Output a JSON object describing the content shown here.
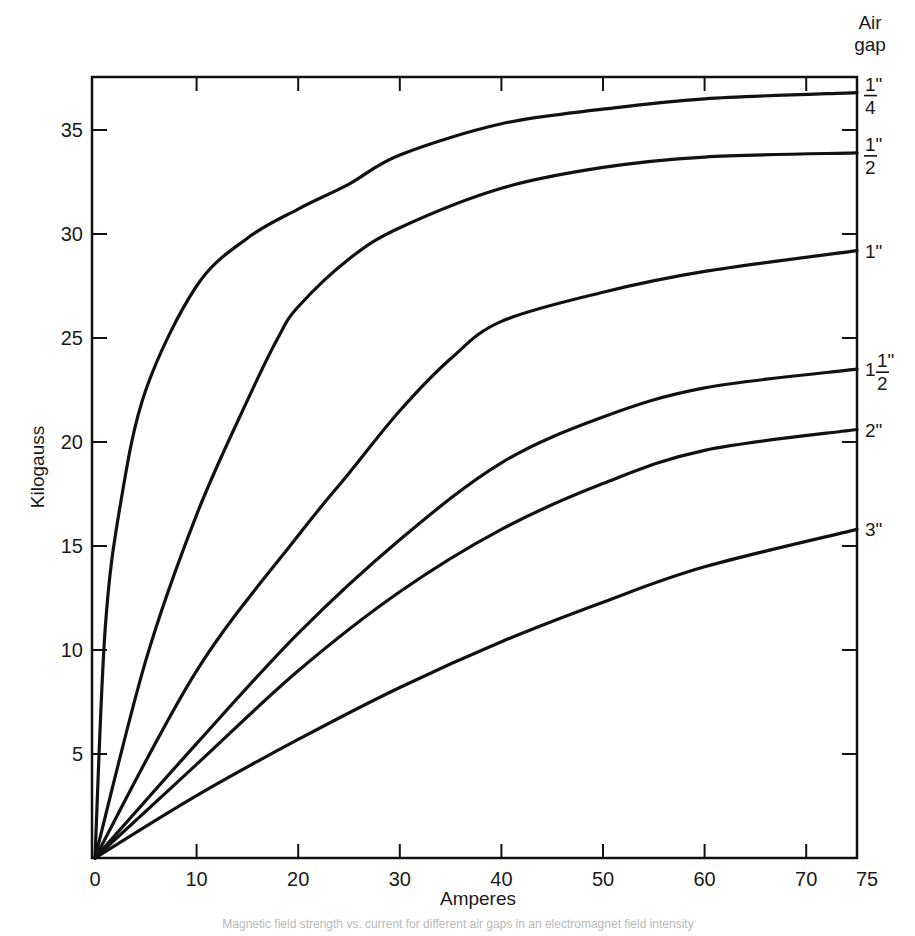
{
  "chart_data": {
    "type": "line",
    "title": "",
    "xlabel": "Amperes",
    "ylabel": "Kilogauss",
    "xlim": [
      0,
      75
    ],
    "ylim": [
      0,
      37.5
    ],
    "grid": false,
    "x_ticks": [
      0,
      10,
      20,
      30,
      40,
      50,
      60,
      70,
      75
    ],
    "x_tick_labels": [
      "0",
      "10",
      "20",
      "30",
      "40",
      "50",
      "60",
      "70",
      "75"
    ],
    "y_ticks": [
      5,
      10,
      15,
      20,
      25,
      30,
      35
    ],
    "y_tick_labels": [
      "5",
      "10",
      "15",
      "20",
      "25",
      "30",
      "35"
    ],
    "legend_title": "Air gap",
    "legend_position": "right edge, labels at curve ends",
    "series": [
      {
        "name": "1/4\"",
        "label_whole": "",
        "label_num": "1",
        "label_den": "4",
        "x": [
          0,
          1,
          2.5,
          5,
          10,
          15,
          20,
          25,
          30,
          40,
          50,
          60,
          75
        ],
        "y": [
          0,
          11,
          17,
          22.5,
          27.5,
          29.8,
          31.2,
          32.4,
          33.8,
          35.3,
          36.0,
          36.5,
          36.8
        ]
      },
      {
        "name": "1/2\"",
        "label_whole": "",
        "label_num": "1",
        "label_den": "2",
        "x": [
          0,
          5,
          10,
          15,
          18,
          20,
          25,
          30,
          40,
          50,
          60,
          75
        ],
        "y": [
          0,
          9.5,
          16.5,
          22,
          25,
          26.5,
          28.8,
          30.3,
          32.2,
          33.2,
          33.7,
          33.9
        ]
      },
      {
        "name": "1\"",
        "label_whole": "1\"",
        "label_num": "",
        "label_den": "",
        "x": [
          0,
          10,
          20,
          25,
          30,
          35,
          40,
          50,
          60,
          75
        ],
        "y": [
          0,
          9,
          15.5,
          18.5,
          21.5,
          24,
          25.8,
          27.2,
          28.2,
          29.2
        ]
      },
      {
        "name": "1 1/2\"",
        "label_whole": "1",
        "label_num": "1",
        "label_den": "2",
        "x": [
          0,
          10,
          20,
          30,
          40,
          50,
          60,
          75
        ],
        "y": [
          0,
          5.5,
          10.8,
          15.3,
          19,
          21.2,
          22.6,
          23.5
        ]
      },
      {
        "name": "2\"",
        "label_whole": "2\"",
        "label_num": "",
        "label_den": "",
        "x": [
          0,
          10,
          20,
          30,
          40,
          50,
          60,
          75
        ],
        "y": [
          0,
          4.5,
          9,
          12.8,
          15.8,
          18,
          19.6,
          20.6
        ]
      },
      {
        "name": "3\"",
        "label_whole": "3\"",
        "label_num": "",
        "label_den": "",
        "x": [
          0,
          10,
          20,
          30,
          40,
          50,
          60,
          75
        ],
        "y": [
          0,
          3,
          5.7,
          8.2,
          10.4,
          12.3,
          14,
          15.8
        ]
      }
    ],
    "right_axis_ticks_kG": [
      5,
      10,
      15,
      20,
      25,
      30,
      35
    ],
    "colors": {
      "line": "#111111",
      "background": "#ffffff"
    }
  },
  "legend": {
    "title_line1": "Air",
    "title_line2": "gap"
  },
  "caption": {
    "text": "Magnetic field strength vs. current for different air gaps in an electromagnet field intensity"
  }
}
